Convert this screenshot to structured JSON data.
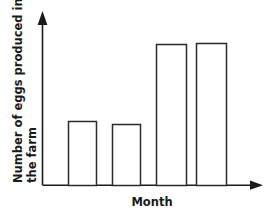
{
  "chart_data": {
    "type": "bar",
    "title": "",
    "subtitle": "",
    "xlabel": "Month",
    "ylabel": "Number of eggs produced in the farm",
    "ylabel_line1": "Number of eggs produced in",
    "ylabel_line2": "the farm",
    "categories": [
      "",
      "",
      "",
      ""
    ],
    "values": [
      45,
      43,
      90,
      91
    ],
    "ylim": [
      0,
      100
    ],
    "xlim": [
      0,
      5
    ],
    "grid": false,
    "legend": null,
    "legend_position": "none",
    "tick_labels_x": [],
    "tick_labels_y": [],
    "annotations": [],
    "axis_arrows": {
      "y_axis_arrow": "up-arrow",
      "x_axis_arrow": "right-arrow"
    },
    "bar_style": {
      "fill": "#ffffff",
      "stroke": "#2b2b2b",
      "stroke_width": 1.5
    },
    "bars": [
      {
        "index": 1,
        "value": 45,
        "x_left": 68,
        "x_right": 96,
        "top_y": 121
      },
      {
        "index": 2,
        "value": 43,
        "x_left": 112,
        "x_right": 140,
        "top_y": 124
      },
      {
        "index": 3,
        "value": 90,
        "x_left": 156,
        "x_right": 186,
        "top_y": 44
      },
      {
        "index": 4,
        "value": 91,
        "x_left": 196,
        "x_right": 226,
        "top_y": 43
      }
    ]
  },
  "colors": {
    "background": "#ffffff",
    "axis": "#1a1a1a",
    "bar_outline": "#2b2b2b",
    "text": "#1a1a1a"
  }
}
